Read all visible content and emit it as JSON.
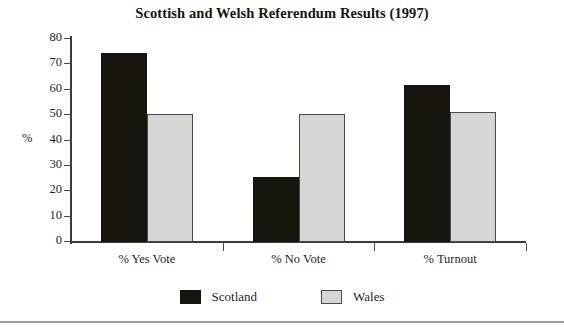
{
  "chart_data": {
    "type": "bar",
    "title": "Scottish and Welsh Referendum Results (1997)",
    "xlabel": "",
    "ylabel": "%",
    "ylim": [
      0,
      80
    ],
    "yticks": [
      0,
      10,
      20,
      30,
      40,
      50,
      60,
      70,
      80
    ],
    "grid": false,
    "legend_position": "bottom-center",
    "categories": [
      "% Yes Vote",
      "% No Vote",
      "% Turnout"
    ],
    "series": [
      {
        "name": "Scotland",
        "color": "#16160f",
        "values": [
          74.3,
          25.7,
          62.0
        ]
      },
      {
        "name": "Wales",
        "color": "#d6d6d3",
        "values": [
          50.3,
          50.3,
          51.3
        ]
      }
    ]
  },
  "legend": {
    "items": [
      {
        "label": "Scotland"
      },
      {
        "label": "Wales"
      }
    ]
  }
}
